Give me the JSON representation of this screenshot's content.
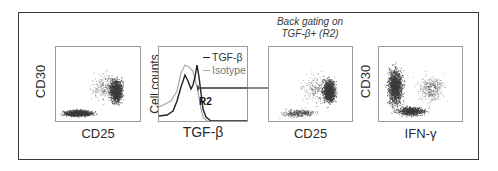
{
  "figure": {
    "panels": [
      {
        "id": "p1",
        "type": "dot_plot",
        "xlabel": "CD25",
        "ylabel": "CD30"
      },
      {
        "id": "p2",
        "type": "histogram",
        "xlabel": "TGF-β",
        "ylabel": "Cell counts",
        "legend": [
          {
            "label": "TGF-β",
            "color": "#222222"
          },
          {
            "label": "Isotype",
            "color": "#a8a8a8"
          }
        ],
        "gate_label": "R2"
      },
      {
        "id": "p3",
        "type": "dot_plot",
        "title_line1": "Back gating on",
        "title_line2": "TGF-β+ (R2)",
        "xlabel": "CD25",
        "ylabel": ""
      },
      {
        "id": "p4",
        "type": "dot_plot",
        "xlabel": "IFN-γ",
        "ylabel": "CD30"
      }
    ],
    "arrow": {
      "from": "R2 gate",
      "to": "Back gating panel"
    }
  },
  "colors": {
    "frame": "#3a3a3a",
    "dots": "#3c3c3c",
    "axis": "#9a9a9a"
  }
}
